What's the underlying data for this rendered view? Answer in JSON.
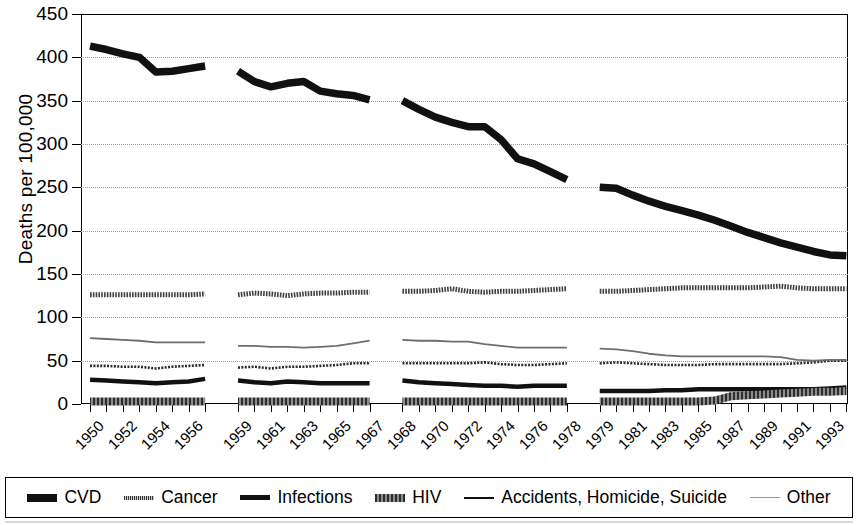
{
  "chart_data": {
    "type": "line",
    "title": "",
    "xlabel": "",
    "ylabel": "Deaths per 100,000",
    "ylim": [
      0,
      450
    ],
    "ytick_labels": [
      "0",
      "50",
      "100",
      "150",
      "200",
      "250",
      "300",
      "350",
      "400",
      "450"
    ],
    "ytick_values": [
      0,
      50,
      100,
      150,
      200,
      250,
      300,
      350,
      400,
      450
    ],
    "grid": true,
    "legend_position": "bottom",
    "x_axis_note": "Four disjoint ICD revision eras separated by gaps; tick labels shown every other year within each era",
    "xtick_labels": [
      "1950",
      "1952",
      "1954",
      "1956",
      "1959",
      "1961",
      "1963",
      "1965",
      "1967",
      "1968",
      "1970",
      "1972",
      "1974",
      "1976",
      "1978",
      "1979",
      "1981",
      "1983",
      "1985",
      "1987",
      "1989",
      "1991",
      "1993"
    ],
    "eras": [
      {
        "name": "1950-1957",
        "x": [
          1950,
          1951,
          1952,
          1953,
          1954,
          1955,
          1956,
          1957
        ]
      },
      {
        "name": "1959-1967",
        "x": [
          1959,
          1960,
          1961,
          1962,
          1963,
          1964,
          1965,
          1966,
          1967
        ]
      },
      {
        "name": "1968-1978",
        "x": [
          1968,
          1969,
          1970,
          1971,
          1972,
          1973,
          1974,
          1975,
          1976,
          1977,
          1978
        ]
      },
      {
        "name": "1979-1994",
        "x": [
          1979,
          1980,
          1981,
          1982,
          1983,
          1984,
          1985,
          1986,
          1987,
          1988,
          1989,
          1990,
          1991,
          1992,
          1993,
          1994
        ]
      }
    ],
    "series": [
      {
        "name": "CVD",
        "color": "#111111",
        "width": 7.5,
        "style": "solid",
        "segments": [
          {
            "x": [
              1950,
              1951,
              1952,
              1953,
              1954,
              1955,
              1956,
              1957
            ],
            "values": [
              413,
              409,
              404,
              400,
              383,
              384,
              387,
              390
            ]
          },
          {
            "x": [
              1959,
              1960,
              1961,
              1962,
              1963,
              1964,
              1965,
              1966,
              1967
            ],
            "values": [
              384,
              372,
              366,
              370,
              372,
              361,
              358,
              356,
              351
            ]
          },
          {
            "x": [
              1968,
              1969,
              1970,
              1971,
              1972,
              1973,
              1974,
              1975,
              1976,
              1977,
              1978
            ],
            "values": [
              350,
              340,
              331,
              325,
              320,
              320,
              305,
              283,
              277,
              268,
              259
            ]
          },
          {
            "x": [
              1979,
              1980,
              1981,
              1982,
              1983,
              1984,
              1985,
              1986,
              1987,
              1988,
              1989,
              1990,
              1991,
              1992,
              1993,
              1994
            ],
            "values": [
              250,
              249,
              241,
              234,
              228,
              223,
              218,
              212,
              205,
              198,
              192,
              186,
              181,
              176,
              172,
              171
            ]
          }
        ]
      },
      {
        "name": "Cancer",
        "color": "#3f3f3f",
        "width": 5,
        "style": "dotted-thick",
        "segments": [
          {
            "x": [
              1950,
              1951,
              1952,
              1953,
              1954,
              1955,
              1956,
              1957
            ],
            "values": [
              126,
              126,
              126,
              126,
              126,
              126,
              126,
              127
            ]
          },
          {
            "x": [
              1959,
              1960,
              1961,
              1962,
              1963,
              1964,
              1965,
              1966,
              1967
            ],
            "values": [
              126,
              128,
              127,
              125,
              127,
              128,
              128,
              129,
              129
            ]
          },
          {
            "x": [
              1968,
              1969,
              1970,
              1971,
              1972,
              1973,
              1974,
              1975,
              1976,
              1977,
              1978
            ],
            "values": [
              130,
              130,
              131,
              133,
              130,
              129,
              130,
              130,
              131,
              132,
              133
            ]
          },
          {
            "x": [
              1979,
              1980,
              1981,
              1982,
              1983,
              1984,
              1985,
              1986,
              1987,
              1988,
              1989,
              1990,
              1991,
              1992,
              1993,
              1994
            ],
            "values": [
              130,
              130,
              131,
              132,
              133,
              134,
              134,
              134,
              134,
              134,
              135,
              136,
              134,
              133,
              133,
              133
            ]
          }
        ]
      },
      {
        "name": "Infections",
        "color": "#111111",
        "width": 4.5,
        "style": "solid",
        "segments": [
          {
            "x": [
              1950,
              1951,
              1952,
              1953,
              1954,
              1955,
              1956,
              1957
            ],
            "values": [
              28,
              27,
              26,
              25,
              24,
              25,
              26,
              29
            ]
          },
          {
            "x": [
              1959,
              1960,
              1961,
              1962,
              1963,
              1964,
              1965,
              1966,
              1967
            ],
            "values": [
              27,
              25,
              24,
              26,
              25,
              24,
              24,
              24,
              24
            ]
          },
          {
            "x": [
              1968,
              1969,
              1970,
              1971,
              1972,
              1973,
              1974,
              1975,
              1976,
              1977,
              1978
            ],
            "values": [
              27,
              25,
              24,
              23,
              22,
              21,
              21,
              20,
              21,
              21,
              21
            ]
          },
          {
            "x": [
              1979,
              1980,
              1981,
              1982,
              1983,
              1984,
              1985,
              1986,
              1987,
              1988,
              1989,
              1990,
              1991,
              1992,
              1993,
              1994
            ],
            "values": [
              15,
              15,
              15,
              15,
              16,
              16,
              17,
              17,
              17,
              17,
              17,
              17,
              17,
              17,
              18,
              19
            ]
          }
        ]
      },
      {
        "name": "HIV",
        "color": "#555555",
        "width": 8,
        "style": "hatched",
        "segments": [
          {
            "x": [
              1950,
              1951,
              1952,
              1953,
              1954,
              1955,
              1956,
              1957
            ],
            "values": [
              3,
              3,
              3,
              3,
              3,
              3,
              3,
              3
            ]
          },
          {
            "x": [
              1959,
              1960,
              1961,
              1962,
              1963,
              1964,
              1965,
              1966,
              1967
            ],
            "values": [
              3,
              3,
              3,
              3,
              3,
              3,
              3,
              3,
              3
            ]
          },
          {
            "x": [
              1968,
              1969,
              1970,
              1971,
              1972,
              1973,
              1974,
              1975,
              1976,
              1977,
              1978
            ],
            "values": [
              3,
              3,
              3,
              3,
              3,
              3,
              3,
              3,
              3,
              3,
              3
            ]
          },
          {
            "x": [
              1979,
              1980,
              1981,
              1982,
              1983,
              1984,
              1985,
              1986,
              1987,
              1988,
              1989,
              1990,
              1991,
              1992,
              1993,
              1994
            ],
            "values": [
              3,
              3,
              3,
              3,
              3,
              3,
              3,
              4,
              9,
              10,
              11,
              12,
              13,
              14,
              14,
              15
            ]
          }
        ]
      },
      {
        "name": "Accidents, Homicide, Suicide",
        "color": "#2b2b2b",
        "width": 2.6,
        "style": "dotted-thin",
        "segments": [
          {
            "x": [
              1950,
              1951,
              1952,
              1953,
              1954,
              1955,
              1956,
              1957
            ],
            "values": [
              44,
              44,
              43,
              43,
              41,
              43,
              44,
              45
            ]
          },
          {
            "x": [
              1959,
              1960,
              1961,
              1962,
              1963,
              1964,
              1965,
              1966,
              1967
            ],
            "values": [
              42,
              43,
              41,
              43,
              43,
              44,
              45,
              47,
              47
            ]
          },
          {
            "x": [
              1968,
              1969,
              1970,
              1971,
              1972,
              1973,
              1974,
              1975,
              1976,
              1977,
              1978
            ],
            "values": [
              47,
              47,
              47,
              47,
              47,
              48,
              46,
              45,
              45,
              46,
              47
            ]
          },
          {
            "x": [
              1979,
              1980,
              1981,
              1982,
              1983,
              1984,
              1985,
              1986,
              1987,
              1988,
              1989,
              1990,
              1991,
              1992,
              1993,
              1994
            ],
            "values": [
              47,
              48,
              47,
              46,
              45,
              45,
              45,
              46,
              46,
              46,
              46,
              46,
              47,
              48,
              50,
              50
            ]
          }
        ]
      },
      {
        "name": "Other",
        "color": "#6e6e6e",
        "width": 1.8,
        "style": "solid",
        "segments": [
          {
            "x": [
              1950,
              1951,
              1952,
              1953,
              1954,
              1955,
              1956,
              1957
            ],
            "values": [
              76,
              75,
              74,
              73,
              71,
              71,
              71,
              71
            ]
          },
          {
            "x": [
              1959,
              1960,
              1961,
              1962,
              1963,
              1964,
              1965,
              1966,
              1967
            ],
            "values": [
              67,
              67,
              66,
              66,
              65,
              66,
              67,
              70,
              73
            ]
          },
          {
            "x": [
              1968,
              1969,
              1970,
              1971,
              1972,
              1973,
              1974,
              1975,
              1976,
              1977,
              1978
            ],
            "values": [
              74,
              73,
              73,
              72,
              72,
              69,
              67,
              65,
              65,
              65,
              65
            ]
          },
          {
            "x": [
              1979,
              1980,
              1981,
              1982,
              1983,
              1984,
              1985,
              1986,
              1987,
              1988,
              1989,
              1990,
              1991,
              1992,
              1993,
              1994
            ],
            "values": [
              64,
              63,
              61,
              58,
              56,
              55,
              55,
              55,
              55,
              55,
              55,
              54,
              51,
              50,
              51,
              51
            ]
          }
        ]
      }
    ]
  },
  "legend": {
    "items": [
      {
        "label": "CVD",
        "swatch": "cvd"
      },
      {
        "label": "Cancer",
        "swatch": "cancer"
      },
      {
        "label": "Infections",
        "swatch": "inf"
      },
      {
        "label": "HIV",
        "swatch": "hiv"
      },
      {
        "label": "Accidents, Homicide, Suicide",
        "swatch": "acc"
      },
      {
        "label": "Other",
        "swatch": "other"
      }
    ]
  }
}
